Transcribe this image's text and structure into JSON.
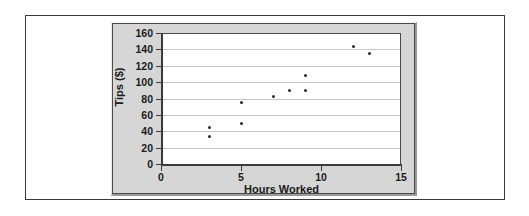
{
  "figure": {
    "panel_background": "#d6d6d6",
    "plot_background": "#ffffff",
    "marker_color": "#2a2a2a",
    "gridline_color": "#c4c4c4",
    "axis_color": "#3a3a3a"
  },
  "chart_data": {
    "type": "scatter",
    "title": "",
    "xlabel": "Hours Worked",
    "ylabel": "Tips ($)",
    "xlim": [
      0,
      15
    ],
    "ylim": [
      0,
      160
    ],
    "xticks": [
      0,
      5,
      10,
      15
    ],
    "xtick_labels": [
      "0",
      "5",
      "10",
      "15"
    ],
    "yticks": [
      0,
      20,
      40,
      60,
      80,
      100,
      120,
      140,
      160
    ],
    "ytick_labels": [
      "0",
      "20",
      "40",
      "60",
      "80",
      "100",
      "120",
      "140",
      "160"
    ],
    "grid": "horizontal",
    "legend": "none",
    "points": [
      {
        "x": 3,
        "y": 44
      },
      {
        "x": 3,
        "y": 33
      },
      {
        "x": 5,
        "y": 75
      },
      {
        "x": 5,
        "y": 50
      },
      {
        "x": 7,
        "y": 83
      },
      {
        "x": 8,
        "y": 90
      },
      {
        "x": 9,
        "y": 90
      },
      {
        "x": 9,
        "y": 108
      },
      {
        "x": 12,
        "y": 144
      },
      {
        "x": 13,
        "y": 135
      }
    ]
  }
}
